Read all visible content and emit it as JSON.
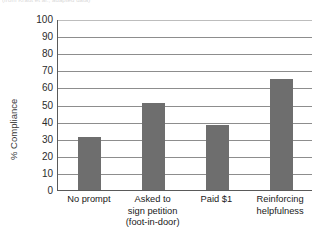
{
  "top_caption": "(from Kraut et al.; adapted data)",
  "chart_data": {
    "type": "bar",
    "title": "",
    "subtitle": "",
    "xlabel": "",
    "ylabel": "% Compliance",
    "ylim": [
      0,
      100
    ],
    "ytick_step": 10,
    "grid": true,
    "legend": false,
    "bar_color": "#6e6e6e",
    "axis_color": "#5a5a5a",
    "grid_color": "#8d8d8d",
    "yticks": [
      "100",
      "90",
      "80",
      "70",
      "60",
      "50",
      "40",
      "30",
      "20",
      "10",
      "0"
    ],
    "categories": [
      "No prompt",
      "Asked to sign petition (foot-in-door)",
      "Paid $1",
      "Reinforcing helpfulness"
    ],
    "category_lines": [
      [
        "No prompt"
      ],
      [
        "Asked to",
        "sign petition",
        "(foot-in-door)"
      ],
      [
        "Paid $1"
      ],
      [
        "Reinforcing",
        "helpfulness"
      ]
    ],
    "values": [
      31,
      51,
      38,
      65
    ]
  }
}
